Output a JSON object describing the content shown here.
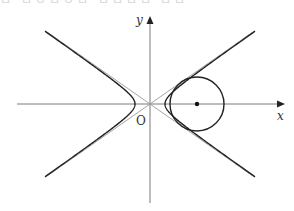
{
  "top_fragment": "ㅁ ㅁㅇㅁㅇㅁ ㅁㅁㅁㅁ ㅁㅁ",
  "labels": {
    "y_axis": "y",
    "x_axis": "x",
    "origin": "O"
  },
  "geometry": {
    "origin_px": [
      150,
      104
    ],
    "hyperbola": {
      "a": 15,
      "b": 10.5,
      "equation": "x^2/a^2 - y^2/b^2 = 1"
    },
    "asymptotes": "y = ±(b/a)x",
    "circle": {
      "center_px": [
        197,
        104
      ],
      "radius": 27
    }
  },
  "colors": {
    "curve": "#222222",
    "asymptote": "#9a9a9a",
    "axis": "#7a7a7a"
  }
}
